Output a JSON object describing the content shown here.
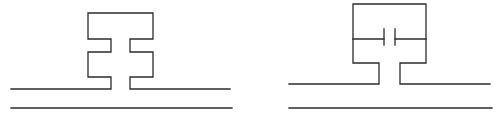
{
  "diagram": {
    "type": "circuit-schematic",
    "background": "#ffffff",
    "stroke_color": "#2b2b2b",
    "figures": [
      {
        "id": "left",
        "description": "Stub resonator shape with two notches (inductive meander) above a two-line transmission line",
        "elements": [
          "upper-conductor-line",
          "lower-conductor-line",
          "notched-stub"
        ]
      },
      {
        "id": "right",
        "description": "Rectangular loop resonator with series capacitor gap in middle, above a two-line transmission line",
        "elements": [
          "upper-conductor-line",
          "lower-conductor-line",
          "loop-stub",
          "capacitor-gap"
        ]
      }
    ]
  }
}
